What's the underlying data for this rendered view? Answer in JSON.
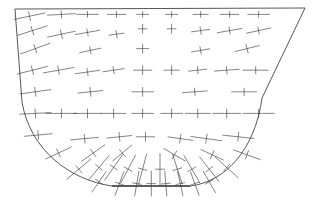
{
  "diagram": {
    "title": "",
    "stroke_color": "#333333",
    "background": "#ffffff",
    "boundary_shape": "trapezoid-top with rounded U bottom",
    "crosses": [
      {
        "x": 0.05,
        "y": 0.04,
        "a": -12,
        "major": 1.0,
        "minor": 0.3
      },
      {
        "x": 0.16,
        "y": 0.03,
        "a": -3,
        "major": 0.9,
        "minor": 0.25
      },
      {
        "x": 0.25,
        "y": 0.03,
        "a": 0,
        "major": 0.7,
        "minor": 0.2
      },
      {
        "x": 0.35,
        "y": 0.03,
        "a": 0,
        "major": 0.6,
        "minor": 0.2
      },
      {
        "x": 0.44,
        "y": 0.03,
        "a": 0,
        "major": 0.4,
        "minor": 0.2
      },
      {
        "x": 0.54,
        "y": 0.03,
        "a": 0,
        "major": 0.4,
        "minor": 0.2
      },
      {
        "x": 0.64,
        "y": 0.03,
        "a": 0,
        "major": 0.5,
        "minor": 0.2
      },
      {
        "x": 0.74,
        "y": 0.03,
        "a": 0,
        "major": 0.6,
        "minor": 0.2
      },
      {
        "x": 0.84,
        "y": 0.03,
        "a": 0,
        "major": 0.7,
        "minor": 0.2
      },
      {
        "x": 0.06,
        "y": 0.12,
        "a": -18,
        "major": 1.0,
        "minor": 0.3
      },
      {
        "x": 0.16,
        "y": 0.14,
        "a": -12,
        "major": 0.9,
        "minor": 0.3
      },
      {
        "x": 0.25,
        "y": 0.13,
        "a": -10,
        "major": 0.8,
        "minor": 0.25
      },
      {
        "x": 0.35,
        "y": 0.14,
        "a": -8,
        "major": 0.5,
        "minor": 0.25
      },
      {
        "x": 0.44,
        "y": 0.11,
        "a": 0,
        "major": 0.3,
        "minor": 0.3
      },
      {
        "x": 0.54,
        "y": 0.11,
        "a": 0,
        "major": 0.3,
        "minor": 0.3
      },
      {
        "x": 0.64,
        "y": 0.12,
        "a": -8,
        "major": 0.6,
        "minor": 0.25
      },
      {
        "x": 0.74,
        "y": 0.12,
        "a": -10,
        "major": 0.8,
        "minor": 0.25
      },
      {
        "x": 0.84,
        "y": 0.12,
        "a": -12,
        "major": 0.8,
        "minor": 0.25
      },
      {
        "x": 0.07,
        "y": 0.22,
        "a": -20,
        "major": 1.0,
        "minor": 0.3
      },
      {
        "x": 0.26,
        "y": 0.23,
        "a": -12,
        "major": 0.7,
        "minor": 0.25
      },
      {
        "x": 0.44,
        "y": 0.22,
        "a": 0,
        "major": 0.4,
        "minor": 0.3
      },
      {
        "x": 0.64,
        "y": 0.23,
        "a": -10,
        "major": 0.6,
        "minor": 0.25
      },
      {
        "x": 0.8,
        "y": 0.22,
        "a": -14,
        "major": 0.8,
        "minor": 0.3
      },
      {
        "x": 0.06,
        "y": 0.34,
        "a": -14,
        "major": 1.0,
        "minor": 0.3
      },
      {
        "x": 0.15,
        "y": 0.34,
        "a": -10,
        "major": 1.0,
        "minor": 0.3
      },
      {
        "x": 0.25,
        "y": 0.35,
        "a": -8,
        "major": 0.8,
        "minor": 0.25
      },
      {
        "x": 0.34,
        "y": 0.34,
        "a": -8,
        "major": 0.7,
        "minor": 0.25
      },
      {
        "x": 0.44,
        "y": 0.34,
        "a": 0,
        "major": 0.6,
        "minor": 0.3
      },
      {
        "x": 0.54,
        "y": 0.34,
        "a": 0,
        "major": 0.5,
        "minor": 0.3
      },
      {
        "x": 0.63,
        "y": 0.34,
        "a": -6,
        "major": 0.6,
        "minor": 0.25
      },
      {
        "x": 0.73,
        "y": 0.34,
        "a": -4,
        "major": 0.8,
        "minor": 0.25
      },
      {
        "x": 0.83,
        "y": 0.34,
        "a": 0,
        "major": 0.8,
        "minor": 0.25
      },
      {
        "x": 0.07,
        "y": 0.46,
        "a": -8,
        "major": 1.0,
        "minor": 0.3
      },
      {
        "x": 0.26,
        "y": 0.46,
        "a": -6,
        "major": 0.8,
        "minor": 0.3
      },
      {
        "x": 0.44,
        "y": 0.46,
        "a": 0,
        "major": 0.7,
        "minor": 0.3
      },
      {
        "x": 0.62,
        "y": 0.46,
        "a": -4,
        "major": 0.8,
        "minor": 0.25
      },
      {
        "x": 0.79,
        "y": 0.46,
        "a": 0,
        "major": 0.8,
        "minor": 0.25
      },
      {
        "x": 0.07,
        "y": 0.58,
        "a": -3,
        "major": 1.0,
        "minor": 0.3
      },
      {
        "x": 0.16,
        "y": 0.58,
        "a": 0,
        "major": 1.0,
        "minor": 0.3
      },
      {
        "x": 0.25,
        "y": 0.58,
        "a": 0,
        "major": 0.9,
        "minor": 0.3
      },
      {
        "x": 0.34,
        "y": 0.58,
        "a": 0,
        "major": 0.8,
        "minor": 0.3
      },
      {
        "x": 0.44,
        "y": 0.58,
        "a": 0,
        "major": 0.7,
        "minor": 0.3
      },
      {
        "x": 0.54,
        "y": 0.58,
        "a": 0,
        "major": 0.7,
        "minor": 0.3
      },
      {
        "x": 0.63,
        "y": 0.58,
        "a": 0,
        "major": 0.8,
        "minor": 0.3
      },
      {
        "x": 0.73,
        "y": 0.58,
        "a": 0,
        "major": 0.9,
        "minor": 0.3
      },
      {
        "x": 0.84,
        "y": 0.58,
        "a": 0,
        "major": 1.0,
        "minor": 0.3
      },
      {
        "x": 0.08,
        "y": 0.7,
        "a": -5,
        "major": 0.9,
        "minor": 0.3
      },
      {
        "x": 0.24,
        "y": 0.72,
        "a": -5,
        "major": 0.9,
        "minor": 0.3
      },
      {
        "x": 0.36,
        "y": 0.71,
        "a": -6,
        "major": 0.8,
        "minor": 0.3
      },
      {
        "x": 0.45,
        "y": 0.71,
        "a": 0,
        "major": 0.6,
        "minor": 0.3
      },
      {
        "x": 0.57,
        "y": 0.72,
        "a": 8,
        "major": 0.8,
        "minor": 0.3
      },
      {
        "x": 0.66,
        "y": 0.72,
        "a": 8,
        "major": 1.0,
        "minor": 0.3
      },
      {
        "x": 0.77,
        "y": 0.71,
        "a": 6,
        "major": 1.0,
        "minor": 0.3
      },
      {
        "x": 0.15,
        "y": 0.8,
        "a": -25,
        "major": 0.9,
        "minor": 0.3
      },
      {
        "x": 0.27,
        "y": 0.8,
        "a": -35,
        "major": 0.9,
        "minor": 0.3
      },
      {
        "x": 0.37,
        "y": 0.8,
        "a": -40,
        "major": 0.8,
        "minor": 0.3
      },
      {
        "x": 0.55,
        "y": 0.81,
        "a": 30,
        "major": 0.8,
        "minor": 0.3
      },
      {
        "x": 0.68,
        "y": 0.81,
        "a": 25,
        "major": 0.8,
        "minor": 0.3
      },
      {
        "x": 0.8,
        "y": 0.81,
        "a": 20,
        "major": 0.9,
        "minor": 0.3
      },
      {
        "x": 0.22,
        "y": 0.89,
        "a": -40,
        "major": 1.0,
        "minor": 0.3
      },
      {
        "x": 0.29,
        "y": 0.88,
        "a": -50,
        "major": 1.0,
        "minor": 0.3
      },
      {
        "x": 0.34,
        "y": 0.88,
        "a": -55,
        "major": 1.0,
        "minor": 0.3
      },
      {
        "x": 0.39,
        "y": 0.89,
        "a": -62,
        "major": 1.0,
        "minor": 0.3
      },
      {
        "x": 0.44,
        "y": 0.89,
        "a": -75,
        "major": 1.0,
        "minor": 0.3
      },
      {
        "x": 0.5,
        "y": 0.89,
        "a": 90,
        "major": 1.0,
        "minor": 0.3
      },
      {
        "x": 0.56,
        "y": 0.89,
        "a": 72,
        "major": 1.0,
        "minor": 0.3
      },
      {
        "x": 0.61,
        "y": 0.89,
        "a": 60,
        "major": 1.0,
        "minor": 0.3
      },
      {
        "x": 0.67,
        "y": 0.89,
        "a": 52,
        "major": 1.0,
        "minor": 0.3
      },
      {
        "x": 0.73,
        "y": 0.88,
        "a": 42,
        "major": 1.0,
        "minor": 0.3
      },
      {
        "x": 0.29,
        "y": 0.96,
        "a": -55,
        "major": 0.8,
        "minor": 0.3
      },
      {
        "x": 0.36,
        "y": 0.97,
        "a": -70,
        "major": 0.8,
        "minor": 0.3
      },
      {
        "x": 0.42,
        "y": 0.97,
        "a": -80,
        "major": 0.8,
        "minor": 0.3
      },
      {
        "x": 0.47,
        "y": 0.97,
        "a": 90,
        "major": 0.8,
        "minor": 0.3
      },
      {
        "x": 0.52,
        "y": 0.97,
        "a": 85,
        "major": 0.8,
        "minor": 0.3
      },
      {
        "x": 0.57,
        "y": 0.97,
        "a": 78,
        "major": 0.8,
        "minor": 0.3
      },
      {
        "x": 0.62,
        "y": 0.97,
        "a": 70,
        "major": 0.8,
        "minor": 0.3
      },
      {
        "x": 0.67,
        "y": 0.96,
        "a": 60,
        "major": 0.8,
        "minor": 0.3
      }
    ]
  }
}
